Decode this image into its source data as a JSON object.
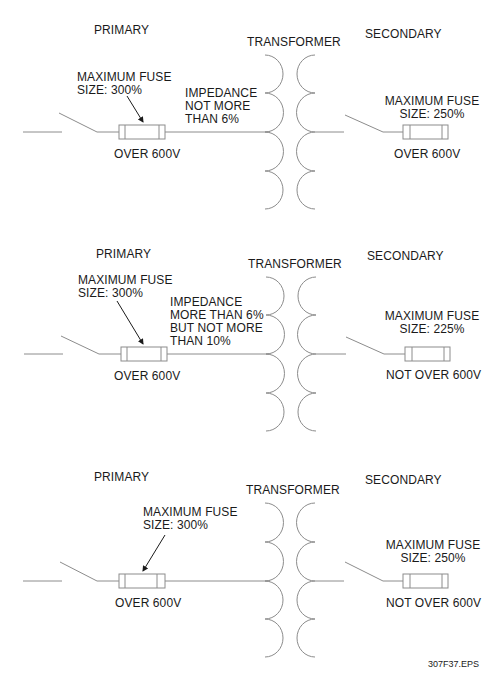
{
  "figure_id": "307F37.EPS",
  "colors": {
    "line": "#8c8c8c",
    "text": "#1a1a1a",
    "background": "#ffffff"
  },
  "diagrams": [
    {
      "primary_label": "PRIMARY",
      "transformer_label": "TRANSFORMER",
      "secondary_label": "SECONDARY",
      "primary_fuse": "MAXIMUM FUSE\nSIZE: 300%",
      "primary_voltage": "OVER 600V",
      "impedance": "IMPEDANCE\nNOT MORE\nTHAN 6%",
      "secondary_fuse": "MAXIMUM FUSE\nSIZE: 250%",
      "secondary_voltage": "OVER 600V"
    },
    {
      "primary_label": "PRIMARY",
      "transformer_label": "TRANSFORMER",
      "secondary_label": "SECONDARY",
      "primary_fuse": "MAXIMUM FUSE\nSIZE: 300%",
      "primary_voltage": "OVER 600V",
      "impedance": "IMPEDANCE\nMORE THAN 6%\nBUT NOT MORE\nTHAN 10%",
      "secondary_fuse": "MAXIMUM FUSE\nSIZE: 225%",
      "secondary_voltage": "NOT OVER 600V"
    },
    {
      "primary_label": "PRIMARY",
      "transformer_label": "TRANSFORMER",
      "secondary_label": "SECONDARY",
      "primary_fuse": "MAXIMUM FUSE\nSIZE: 300%",
      "primary_voltage": "OVER 600V",
      "secondary_fuse": "MAXIMUM FUSE\nSIZE: 250%",
      "secondary_voltage": "NOT OVER 600V"
    }
  ]
}
